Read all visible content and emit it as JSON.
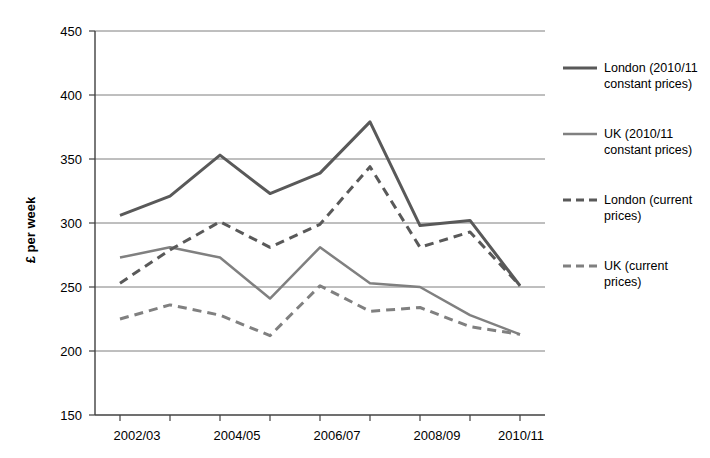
{
  "title_strip": "",
  "chart_data": {
    "type": "line",
    "title": "",
    "xlabel": "",
    "ylabel": "£ per week",
    "ylim": [
      150,
      450
    ],
    "yticks": [
      150,
      200,
      250,
      300,
      350,
      400,
      450
    ],
    "grid": true,
    "legend_position": "right",
    "x": [
      "2002/03",
      "2003/04",
      "2004/05",
      "2005/06",
      "2006/07",
      "2007/08",
      "2008/09",
      "2009/10",
      "2010/11"
    ],
    "xticks_shown": [
      "2002/03",
      "2004/05",
      "2006/07",
      "2008/09",
      "2010/11"
    ],
    "series": [
      {
        "name": "London (2010/11 constant prices)",
        "style": "solid",
        "color": "#595959",
        "width": 3,
        "values": [
          306,
          321,
          353,
          323,
          339,
          379,
          298,
          302,
          251
        ]
      },
      {
        "name": "UK (2010/11 constant prices)",
        "style": "solid",
        "color": "#808080",
        "width": 2.5,
        "values": [
          273,
          281,
          273,
          241,
          281,
          253,
          250,
          228,
          213
        ]
      },
      {
        "name": "London (current prices)",
        "style": "dashed",
        "color": "#595959",
        "width": 3,
        "values": [
          253,
          279,
          301,
          281,
          299,
          344,
          281,
          293,
          251
        ]
      },
      {
        "name": "UK (current prices)",
        "style": "dashed",
        "color": "#808080",
        "width": 3,
        "values": [
          225,
          236,
          228,
          212,
          251,
          231,
          234,
          219,
          213
        ]
      }
    ]
  },
  "legend": {
    "items": [
      {
        "label_line1": "London (2010/11",
        "label_line2": "constant prices)"
      },
      {
        "label_line1": "UK (2010/11",
        "label_line2": "constant prices)"
      },
      {
        "label_line1": "London (current",
        "label_line2": "prices)"
      },
      {
        "label_line1": "UK (current",
        "label_line2": "prices)"
      }
    ]
  },
  "axis": {
    "y_title": "£ per week",
    "y_ticks": [
      "450",
      "400",
      "350",
      "300",
      "250",
      "200",
      "150"
    ],
    "x_ticks": [
      "2002/03",
      "2004/05",
      "2006/07",
      "2008/09",
      "2010/11"
    ]
  }
}
